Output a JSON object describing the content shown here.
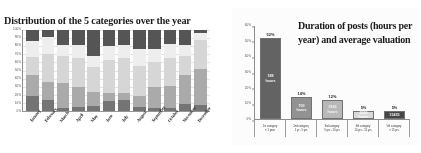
{
  "document": {
    "kind": "scanned-slide-pair"
  },
  "chart_data": [
    {
      "id": "left",
      "type": "bar",
      "stacked": true,
      "normalized": true,
      "title": "Distribution of the 5 categories over the year",
      "xlabel": "",
      "ylabel": "",
      "ylim": [
        0,
        100
      ],
      "grid": true,
      "legend": "none",
      "ytick_labels": [
        "100%",
        "90%",
        "80%",
        "70%",
        "60%",
        "50%",
        "40%",
        "30%",
        "20%",
        "10%",
        "0%"
      ],
      "categories": [
        "January",
        "February",
        "March",
        "April",
        "May",
        "June",
        "July",
        "August",
        "September",
        "October",
        "November",
        "December"
      ],
      "series": [
        {
          "name": "Category 1",
          "color": "#6f6f6f",
          "values": [
            18,
            14,
            4,
            5,
            6,
            12,
            13,
            5,
            4,
            4,
            9,
            8
          ]
        },
        {
          "name": "Category 2",
          "color": "#a8a8a8",
          "values": [
            27,
            22,
            31,
            25,
            18,
            10,
            9,
            13,
            26,
            27,
            36,
            44
          ]
        },
        {
          "name": "Category 3",
          "color": "#d6d6d6",
          "values": [
            22,
            34,
            33,
            35,
            30,
            41,
            43,
            38,
            31,
            34,
            23,
            36
          ]
        },
        {
          "name": "Category 4",
          "color": "#efefef",
          "values": [
            19,
            22,
            14,
            16,
            14,
            17,
            16,
            20,
            16,
            18,
            14,
            8
          ]
        },
        {
          "name": "Category 5",
          "color": "#4f4f4f",
          "values": [
            14,
            8,
            18,
            19,
            32,
            20,
            19,
            24,
            23,
            17,
            18,
            4
          ]
        }
      ]
    },
    {
      "id": "right",
      "type": "bar",
      "stacked": false,
      "title": "Duration of posts (hours per year) and average valuation",
      "xlabel": "",
      "ylabel": "",
      "ylim": [
        0,
        60
      ],
      "grid": false,
      "legend": "none",
      "ytick_labels": [
        "60%",
        "50%",
        "40%",
        "30%",
        "20%",
        "10%",
        "0%"
      ],
      "categories": [
        "1st category\n< 1 year",
        "2nd category\n1 yr - 5 yrs",
        "3rd category\n5 yrs - 10 yrs",
        "4th category\n10 yrs - 15 yrs",
        "5th category\n> 15 yrs"
      ],
      "values": [
        52,
        14,
        12,
        5,
        5
      ],
      "value_labels": [
        "52%",
        "14%",
        "12%",
        "5%",
        "5%"
      ],
      "bar_labels": [
        "188\nhours",
        "700\nhours",
        "2165\nhours",
        "3530\nhours",
        "15435"
      ],
      "bar_colors": [
        "#5e5e5e",
        "#8f8f8f",
        "#b6b6b6",
        "#d9d9d9",
        "#3f3f3f"
      ],
      "bar_text_colors": [
        "#f2f2f2",
        "#f5f5f5",
        "#f7f7f7",
        "#ffffff",
        "#f0f0f0"
      ]
    }
  ]
}
